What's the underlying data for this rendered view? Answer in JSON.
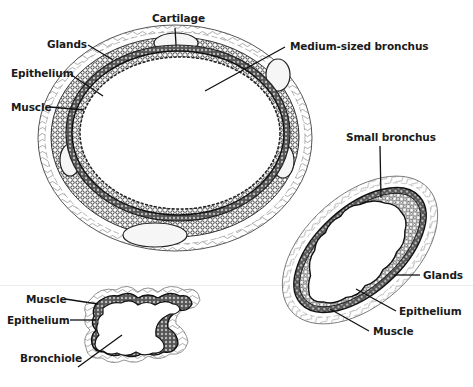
{
  "figure": {
    "structures": [
      {
        "id": "medium-bronchus",
        "name": "Medium-sized bronchus",
        "labels": [
          "Cartilage",
          "Glands",
          "Epithelium",
          "Muscle",
          "Medium-sized bronchus"
        ]
      },
      {
        "id": "small-bronchus",
        "name": "Small bronchus",
        "labels": [
          "Small bronchus",
          "Glands",
          "Epithelium",
          "Muscle"
        ]
      },
      {
        "id": "bronchiole",
        "name": "Bronchiole",
        "labels": [
          "Muscle",
          "Epithelium",
          "Bronchiole"
        ]
      }
    ]
  },
  "labels": {
    "medium": {
      "cartilage": "Cartilage",
      "glands": "Glands",
      "epithelium": "Epithelium",
      "muscle": "Muscle",
      "title": "Medium-sized bronchus"
    },
    "small": {
      "title": "Small bronchus",
      "glands": "Glands",
      "epithelium": "Epithelium",
      "muscle": "Muscle"
    },
    "bronchiole": {
      "muscle": "Muscle",
      "epithelium": "Epithelium",
      "title": "Bronchiole"
    }
  },
  "colors": {
    "ink": "#1a1a1a",
    "tissue": "#3a3a3a",
    "background": "#ffffff"
  }
}
